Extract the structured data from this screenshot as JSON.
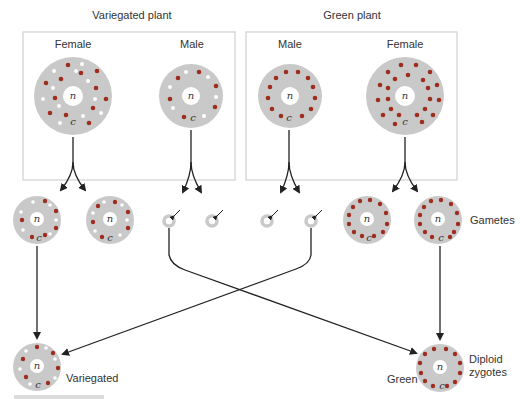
{
  "titles": {
    "variegated_plant": "Variegated plant",
    "green_plant": "Green plant"
  },
  "parents": {
    "variegated_female": "Female",
    "variegated_male": "Male",
    "green_male": "Male",
    "green_female": "Female"
  },
  "labels": {
    "gametes": "Gametes",
    "diploid_line1": "Diploid",
    "diploid_line2": "zygotes",
    "variegated_zygote": "Variegated",
    "green_zygote": "Green",
    "nucleus": "n",
    "cytoplasm": "c"
  },
  "colors": {
    "cytoplasm": "#c9c9c9",
    "green_plastid": "#9e2d20",
    "white_plastid": "#ffffff",
    "arrow": "#222222",
    "box": "#d4d4d4"
  }
}
